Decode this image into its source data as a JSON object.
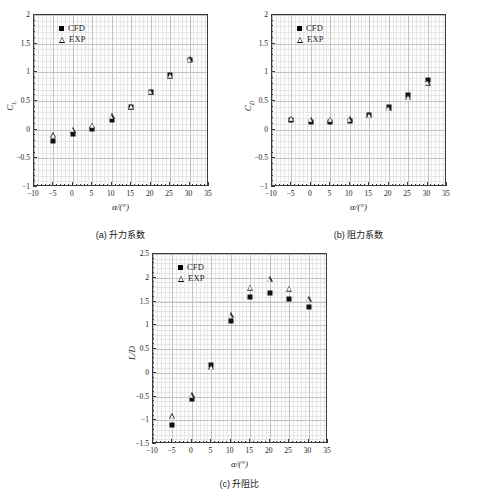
{
  "figure": {
    "legend": {
      "cfd": "CFD",
      "exp": "EXP"
    },
    "xaxis_title": "α/(°)"
  },
  "panels": [
    {
      "id": "a",
      "caption": "(a) 升力系数",
      "ylabel": "C_L",
      "ylabel_main": "C",
      "ylabel_sub": "L"
    },
    {
      "id": "b",
      "caption": "(b) 阻力系数",
      "ylabel": "C_D",
      "ylabel_main": "C",
      "ylabel_sub": "D"
    },
    {
      "id": "c",
      "caption": "(c) 升阻比",
      "ylabel": "L/D",
      "ylabel_main": "L/D",
      "ylabel_sub": ""
    }
  ],
  "chart_data": [
    {
      "type": "scatter",
      "title": "(a) 升力系数",
      "xlabel": "α/(°)",
      "ylabel": "C_L",
      "xlim": [
        -10,
        35
      ],
      "ylim": [
        -1,
        2
      ],
      "xticks": [
        -10,
        -5,
        0,
        5,
        10,
        15,
        20,
        25,
        30,
        35
      ],
      "yticks": [
        -1,
        -0.5,
        0,
        0.5,
        1,
        1.5,
        2
      ],
      "grid": true,
      "legend_position": "upper-left",
      "x": [
        -5,
        0,
        5,
        10,
        15,
        20,
        25,
        30
      ],
      "series": [
        {
          "name": "CFD",
          "marker": "filled-square",
          "values": [
            -0.2,
            -0.08,
            0.01,
            0.17,
            0.4,
            0.65,
            0.95,
            1.22
          ]
        },
        {
          "name": "EXP",
          "marker": "open-triangle",
          "values": [
            -0.15,
            -0.05,
            0.02,
            0.18,
            0.35,
            0.61,
            0.89,
            1.18
          ]
        }
      ]
    },
    {
      "type": "scatter",
      "title": "(b) 阻力系数",
      "xlabel": "α/(°)",
      "ylabel": "C_D",
      "xlim": [
        -10,
        35
      ],
      "ylim": [
        -1,
        2
      ],
      "xticks": [
        -10,
        -5,
        0,
        5,
        10,
        15,
        20,
        25,
        30,
        35
      ],
      "yticks": [
        -1,
        -0.5,
        0,
        0.5,
        1,
        1.5,
        2
      ],
      "grid": true,
      "legend_position": "upper-left",
      "x": [
        -5,
        0,
        5,
        10,
        15,
        20,
        25,
        30
      ],
      "series": [
        {
          "name": "CFD",
          "marker": "filled-square",
          "values": [
            0.16,
            0.13,
            0.13,
            0.15,
            0.25,
            0.39,
            0.6,
            0.87
          ]
        },
        {
          "name": "EXP",
          "marker": "open-triangle",
          "values": [
            0.14,
            0.12,
            0.12,
            0.13,
            0.2,
            0.32,
            0.51,
            0.77
          ]
        }
      ]
    },
    {
      "type": "scatter",
      "title": "(c) 升阻比",
      "xlabel": "α/(°)",
      "ylabel": "L/D",
      "xlim": [
        -10,
        35
      ],
      "ylim": [
        -1.5,
        2.5
      ],
      "xticks": [
        -10,
        -5,
        0,
        5,
        10,
        15,
        20,
        25,
        30,
        35
      ],
      "yticks": [
        -1.5,
        -1,
        -0.5,
        0,
        0.5,
        1,
        1.5,
        2,
        2.5
      ],
      "grid": true,
      "legend_position": "upper-left",
      "x": [
        -5,
        0,
        5,
        10,
        15,
        20,
        25,
        30
      ],
      "series": [
        {
          "name": "CFD",
          "marker": "filled-square",
          "values": [
            -1.1,
            -0.55,
            0.16,
            1.1,
            1.6,
            1.68,
            1.56,
            1.39
          ]
        },
        {
          "name": "EXP",
          "marker": "open-triangle",
          "values": [
            -0.98,
            -0.53,
            0.05,
            1.15,
            1.73,
            1.91,
            1.71,
            1.48
          ]
        }
      ]
    }
  ]
}
